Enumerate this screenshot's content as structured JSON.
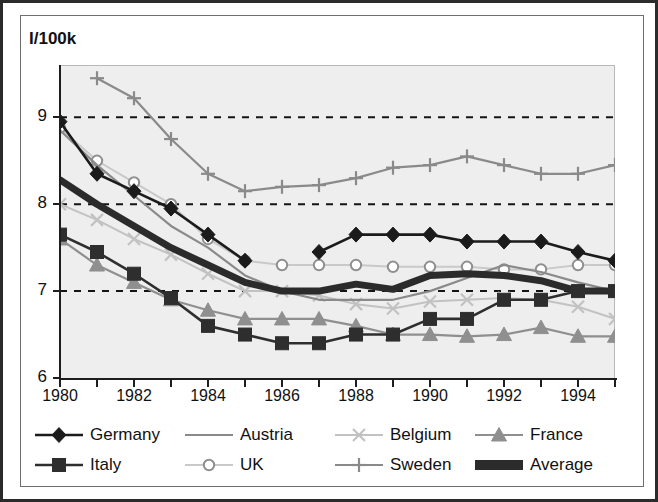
{
  "chart_title": "I/100k",
  "axis": {
    "y_ticks": [
      "9",
      "8",
      "7",
      "6"
    ],
    "x_ticks": [
      "1980",
      "1982",
      "1984",
      "1986",
      "1988",
      "1990",
      "1992",
      "1994"
    ]
  },
  "legend": {
    "row1": [
      {
        "label": "Germany",
        "marker": "diamond",
        "color": "#1b1b1b",
        "width": 2.6
      },
      {
        "label": "Austria",
        "marker": "none",
        "color": "#8a8a8a",
        "width": 2.2
      },
      {
        "label": "Belgium",
        "marker": "x",
        "color": "#c2c2c2",
        "width": 2.0
      },
      {
        "label": "France",
        "marker": "triangle",
        "color": "#8f8f8f",
        "width": 2.2
      }
    ],
    "row2": [
      {
        "label": "Italy",
        "marker": "square",
        "color": "#2e2e2e",
        "width": 2.6
      },
      {
        "label": "UK",
        "marker": "circle",
        "color": "#c9c9c9",
        "width": 2.0
      },
      {
        "label": "Sweden",
        "marker": "plus",
        "color": "#8a8a8a",
        "width": 2.2
      },
      {
        "label": "Average",
        "marker": "band",
        "color": "#2b2b2b",
        "width": 7.0
      }
    ]
  },
  "chart_data": {
    "type": "line",
    "title": "I/100k",
    "xlabel": "",
    "ylabel": "I/100k",
    "xlim": [
      1980,
      1995
    ],
    "ylim": [
      6,
      9.6
    ],
    "yticks": [
      6,
      7,
      8,
      9
    ],
    "grid": "horizontal-dashed at 7, 8, 9",
    "legend_position": "bottom",
    "x": [
      1980,
      1981,
      1982,
      1983,
      1984,
      1985,
      1986,
      1987,
      1988,
      1989,
      1990,
      1991,
      1992,
      1993,
      1994,
      1995
    ],
    "series": [
      {
        "name": "Germany",
        "marker": "diamond",
        "color": "#1b1b1b",
        "width": 2.6,
        "values": [
          8.95,
          8.35,
          8.15,
          7.95,
          7.65,
          7.35,
          null,
          7.45,
          7.65,
          7.65,
          7.65,
          7.57,
          7.57,
          7.57,
          7.45,
          7.35
        ]
      },
      {
        "name": "Austria",
        "marker": "none",
        "color": "#8a8a8a",
        "width": 2.2,
        "values": [
          8.85,
          8.45,
          8.1,
          7.75,
          7.5,
          7.18,
          7.0,
          6.9,
          6.9,
          6.9,
          7.0,
          7.15,
          7.3,
          7.22,
          7.1,
          7.0
        ]
      },
      {
        "name": "Belgium",
        "marker": "x",
        "color": "#c2c2c2",
        "width": 2.0,
        "values": [
          8.0,
          7.82,
          7.6,
          7.42,
          7.2,
          7.0,
          7.0,
          6.95,
          6.85,
          6.8,
          6.88,
          6.9,
          6.92,
          6.9,
          6.82,
          6.68
        ]
      },
      {
        "name": "France",
        "marker": "triangle",
        "color": "#8f8f8f",
        "width": 2.2,
        "values": [
          7.6,
          7.3,
          7.1,
          6.9,
          6.78,
          6.68,
          6.68,
          6.68,
          6.6,
          6.5,
          6.5,
          6.48,
          6.5,
          6.58,
          6.48,
          6.48
        ]
      },
      {
        "name": "Italy",
        "marker": "square",
        "color": "#2e2e2e",
        "width": 2.6,
        "values": [
          7.65,
          7.45,
          7.2,
          6.92,
          6.6,
          6.5,
          6.4,
          6.4,
          6.5,
          6.5,
          6.68,
          6.68,
          6.9,
          6.9,
          7.0,
          7.0
        ]
      },
      {
        "name": "UK",
        "marker": "circle",
        "color": "#c9c9c9",
        "width": 2.0,
        "values": [
          8.88,
          8.5,
          8.25,
          8.0,
          7.6,
          7.35,
          7.3,
          7.3,
          7.3,
          7.28,
          7.28,
          7.28,
          7.25,
          7.25,
          7.3,
          7.3
        ]
      },
      {
        "name": "Sweden",
        "marker": "plus",
        "color": "#8a8a8a",
        "width": 2.2,
        "values": [
          null,
          9.45,
          9.22,
          8.75,
          8.35,
          8.15,
          8.2,
          8.22,
          8.3,
          8.42,
          8.45,
          8.55,
          8.45,
          8.35,
          8.35,
          8.45
        ]
      },
      {
        "name": "Average",
        "marker": "band",
        "color": "#2b2b2b",
        "width": 7.0,
        "values": [
          8.28,
          8.0,
          7.75,
          7.5,
          7.3,
          7.1,
          7.0,
          7.0,
          7.08,
          7.02,
          7.18,
          7.2,
          7.18,
          7.12,
          7.0,
          7.0
        ]
      }
    ]
  }
}
